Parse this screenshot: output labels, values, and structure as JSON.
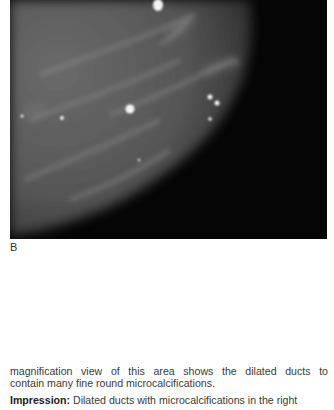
{
  "figure": {
    "panel_label": "B",
    "colors": {
      "tissue": "#5a5a5a",
      "background": "#050505",
      "calcification": "#f5f5f5"
    }
  },
  "text": {
    "line1": "magnification view of this area shows the dilated ducts to",
    "line2": "contain many fine round microcalcifications.",
    "impression_label": "Impression:",
    "impression_text": " Dilated ducts with microcalcifications in the right"
  }
}
